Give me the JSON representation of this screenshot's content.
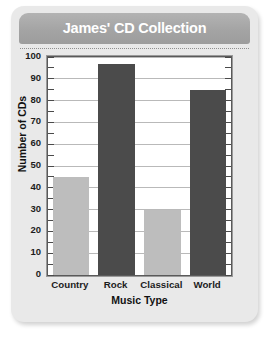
{
  "card": {
    "title": "James' CD Collection"
  },
  "chart_data": {
    "type": "bar",
    "title": "James' CD Collection",
    "xlabel": "Music Type",
    "ylabel": "Number of CDs",
    "categories": [
      "Country",
      "Rock",
      "Classical",
      "World"
    ],
    "values": [
      45,
      97,
      30,
      85
    ],
    "bar_colors": [
      "#bdbdbd",
      "#4b4b4b",
      "#bdbdbd",
      "#4b4b4b"
    ],
    "ylim": [
      0,
      100
    ],
    "ytick_step": 10,
    "yticks": [
      "100",
      "90",
      "80",
      "70",
      "60",
      "50",
      "40",
      "30",
      "20",
      "10",
      "0"
    ],
    "minor_tick_step": 5,
    "grid": true,
    "grid_axis": "y",
    "legend": false
  },
  "colors": {
    "card_background": "#e9e9e9",
    "header_background": "#a4a4a4",
    "title_text": "#ffffff",
    "plot_background": "#ffffff",
    "frame": "#5a5a5a",
    "gridline": "#b9b9b9",
    "bar_light": "#bdbdbd",
    "bar_dark": "#4b4b4b",
    "axis_text": "#1c1c1c"
  }
}
